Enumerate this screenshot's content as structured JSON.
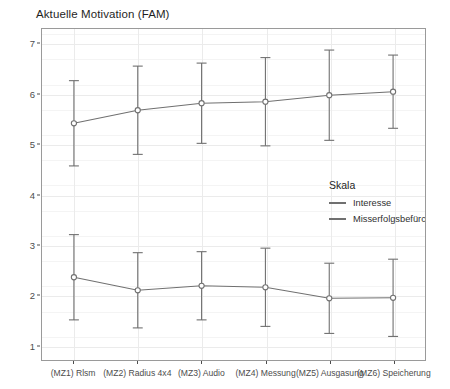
{
  "chart_data": {
    "type": "line",
    "title": "Aktuelle Motivation (FAM)",
    "xlabel": "",
    "ylabel": "Wertebereich (MW / SD)",
    "ylim": [
      0.7,
      7.3
    ],
    "yticks": [
      1,
      2,
      3,
      4,
      5,
      6,
      7
    ],
    "ytick_labels": [
      "1",
      "2",
      "3",
      "4",
      "5",
      "6",
      "7"
    ],
    "grid": true,
    "legend_title": "Skala",
    "legend_position": "inside-right",
    "errorbars": "SD",
    "marker": "open-circle",
    "categories": [
      "(MZ1) Rlsm",
      "(MZ2) Radius 4x4",
      "(MZ3) Audio",
      "(MZ4) Messung",
      "(MZ5) Ausgasung",
      "(MZ6) Speicherung"
    ],
    "series": [
      {
        "name": "Interesse",
        "color": "#707070",
        "values": [
          5.42,
          5.68,
          5.82,
          5.85,
          5.98,
          6.05
        ],
        "sd": [
          0.85,
          0.88,
          0.8,
          0.88,
          0.9,
          0.73
        ]
      },
      {
        "name": "Misserfolgsbefürchtung",
        "color": "#707070",
        "values": [
          2.35,
          2.09,
          2.18,
          2.15,
          1.93,
          1.94
        ],
        "sd": [
          0.85,
          0.75,
          0.68,
          0.78,
          0.7,
          0.77
        ]
      }
    ]
  },
  "colors": {
    "panel_background": "#ffffff",
    "panel_border": "#9a9a9a",
    "gridline": "#ebebeb",
    "line": "#707070",
    "text": "#2a2a2a"
  }
}
